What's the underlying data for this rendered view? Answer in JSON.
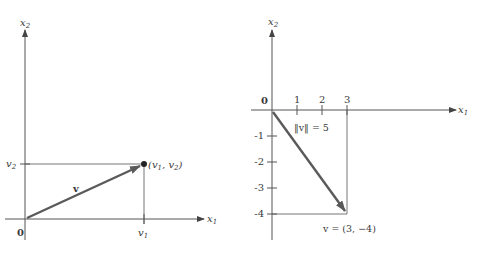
{
  "left_figure": {
    "axis_x_label": "x",
    "axis_x_sub": "1",
    "axis_y_label": "x",
    "axis_y_sub": "2",
    "origin_label": "0",
    "vector_label": "v",
    "point_label_prefix": "(v",
    "point_label_sub1": "1",
    "point_label_mid": ", v",
    "point_label_sub2": "2",
    "point_label_suffix": ")",
    "tick_x_label": "v",
    "tick_x_sub": "1",
    "tick_y_label": "v",
    "tick_y_sub": "2"
  },
  "right_figure": {
    "axis_x_label": "x",
    "axis_x_sub": "1",
    "axis_y_label": "x",
    "axis_y_sub": "2",
    "origin_label": "0",
    "x_ticks": [
      "1",
      "2",
      "3"
    ],
    "y_ticks": [
      "-1",
      "-2",
      "-3",
      "-4"
    ],
    "norm_label": "‖v‖ = 5",
    "vector_label": "v = (3, −4)"
  },
  "colors": {
    "axis": "#555555",
    "vector": "#5a5a5a",
    "text": "#3a3a3a"
  }
}
